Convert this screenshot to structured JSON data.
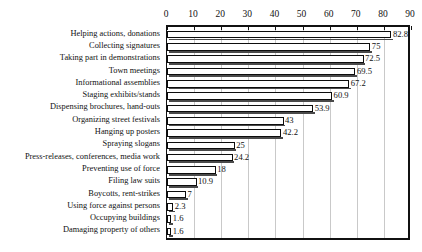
{
  "chart_data": {
    "type": "bar",
    "orientation": "horizontal",
    "title": "",
    "subtitle": "",
    "xlabel": "",
    "ylabel": "",
    "xlim": [
      0,
      90
    ],
    "xticks": [
      0,
      10,
      20,
      30,
      40,
      50,
      60,
      70,
      80,
      90
    ],
    "xtick_labels": [
      "0",
      "10",
      "20",
      "30",
      "40",
      "50",
      "60",
      "70",
      "80",
      "90"
    ],
    "grid": true,
    "legend": false,
    "legend_position": "none",
    "bar_style": {
      "fill": "#ffffff",
      "edge": "#0d0d0d",
      "shadow": "#4a4a4a"
    },
    "categories": [
      "Helping actions, donations",
      "Collecting signatures",
      "Taking part in demonstrations",
      "Town meetings",
      "Informational assemblies",
      "Staging exhibits/stands",
      "Dispensing brochures, hand-outs",
      "Organizing street festivals",
      "Hanging up posters",
      "Spraying slogans",
      "Press-releases, conferences, media work",
      "Preventing use of force",
      "Filing law suits",
      "Boycotts, rent-strikes",
      "Using force against persons",
      "Occupying buildings",
      "Damaging property of others"
    ],
    "values": [
      82.8,
      75,
      72.5,
      69.5,
      67.2,
      60.9,
      53.9,
      43,
      42.2,
      25,
      24.2,
      18,
      10.9,
      7,
      2.3,
      1.6,
      1.6
    ],
    "value_labels": [
      "82.8",
      "75",
      "72.5",
      "69.5",
      "67.2",
      "60.9",
      "53.9",
      "43",
      "42.2",
      "25",
      "24.2",
      "18",
      "10.9",
      "7",
      "2.3",
      "1.6",
      "1.6"
    ]
  }
}
